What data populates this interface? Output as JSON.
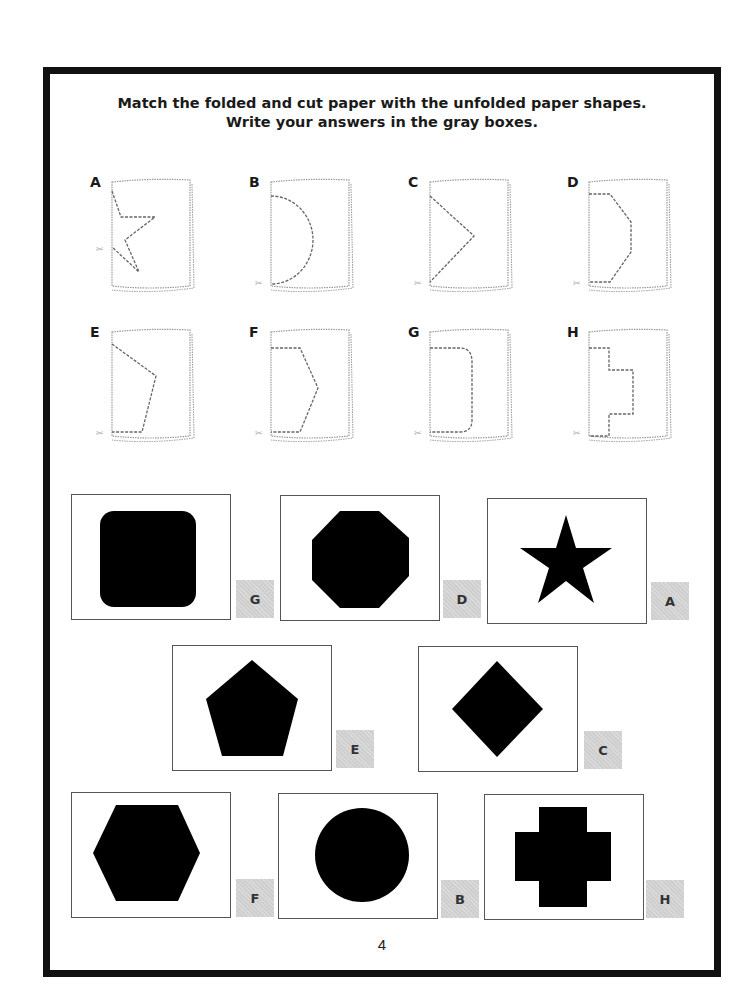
{
  "instructions": {
    "line1": "Match the folded and cut paper with the unfolded paper shapes.",
    "line2": "Write your answers in the gray boxes."
  },
  "folded_papers": [
    {
      "label": "A",
      "cut_shape": "half-star"
    },
    {
      "label": "B",
      "cut_shape": "half-circle"
    },
    {
      "label": "C",
      "cut_shape": "half-diamond"
    },
    {
      "label": "D",
      "cut_shape": "half-octagon"
    },
    {
      "label": "E",
      "cut_shape": "half-pentagon"
    },
    {
      "label": "F",
      "cut_shape": "half-hexagon"
    },
    {
      "label": "G",
      "cut_shape": "half-rounded-square"
    },
    {
      "label": "H",
      "cut_shape": "half-cross"
    }
  ],
  "unfolded_shapes": [
    {
      "shape": "rounded-square",
      "answer": "G"
    },
    {
      "shape": "octagon",
      "answer": "D"
    },
    {
      "shape": "star",
      "answer": "A"
    },
    {
      "shape": "pentagon",
      "answer": "E"
    },
    {
      "shape": "diamond",
      "answer": "C"
    },
    {
      "shape": "hexagon",
      "answer": "F"
    },
    {
      "shape": "circle",
      "answer": "B"
    },
    {
      "shape": "cross",
      "answer": "H"
    }
  ],
  "colors": {
    "frame": "#111111",
    "answer_box": "#cfcfcf",
    "shape_fill": "#000000"
  },
  "page_number": "4"
}
